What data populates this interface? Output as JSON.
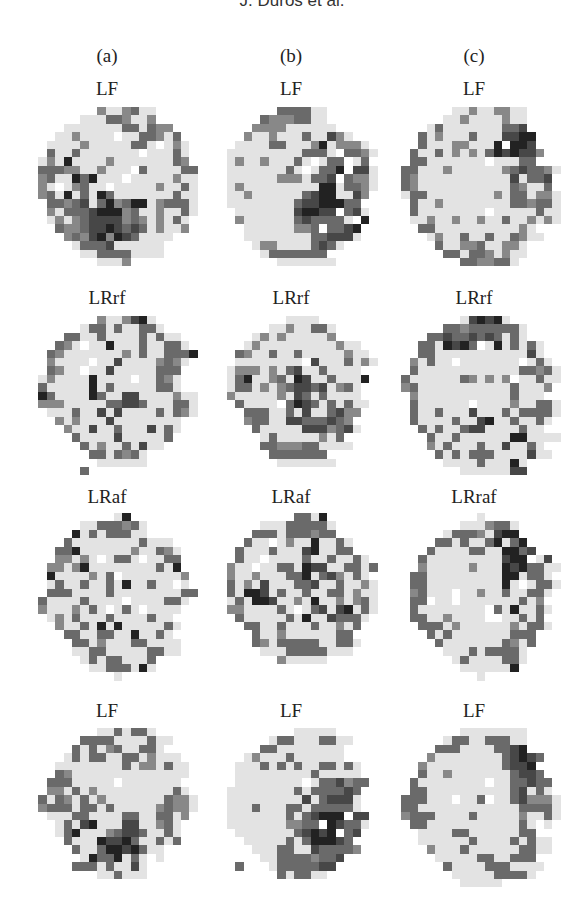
{
  "running_head": "J. Duros et al.",
  "columns": [
    {
      "label": "(a)",
      "center_x": 107
    },
    {
      "label": "(b)",
      "center_x": 291
    },
    {
      "label": "(c)",
      "center_x": 474
    }
  ],
  "chart_data": {
    "type": "heatmap",
    "title": "",
    "column_labels": [
      "(a)",
      "(b)",
      "(c)"
    ],
    "row_panel_titles": [
      [
        "LF",
        "LF",
        "LF"
      ],
      [
        "LRrf",
        "LRrf",
        "LRrf"
      ],
      [
        "LRaf",
        "LRaf",
        "LRraf"
      ],
      [
        "LF",
        "LF",
        "LF"
      ]
    ],
    "grid_size": [
      20,
      20
    ],
    "legend": {
      "o": "outside circle",
      "0": "light gray (#e3e3e3)",
      "w": "white",
      "1": "#a8a8a8",
      "2": "#888888",
      "3": "#6a6a6a",
      "4": "#474747",
      "5": "#222222"
    },
    "panels": [
      {
        "row": 0,
        "col": 0,
        "title": "LF",
        "x": 30,
        "y": 107,
        "rows": [
          "oooooooo2002300ooooo",
          "oooooo000332002ooooo",
          "oooo0000000330322ooo",
          "ooo0020000w0033203oo",
          "oo0000200000330w020o",
          "oo30030000000w00030o",
          "o020500002000000032o",
          "o33322002000w30000330",
          "o2300535000w000002000",
          "o20w02300w0000020030o",
          "o2305030530000000300o",
          "oo3323403523550233300",
          "oo2033345552300200300o",
          "oo02023444423202030o",
          "ooo3223445434302002o",
          "oooo2324525430000ooo",
          "ooooo03334000000oooo",
          "oooooo0033330000oooo",
          "oooooooo0002ooooooooo",
          "oooooooooooooooooooo"
        ]
      },
      {
        "row": 0,
        "col": 1,
        "title": "LF",
        "x": 210,
        "y": 107,
        "rows": [
          "oooooooo333300oooooo",
          "oooooo32223300oooooo",
          "ooooo2222000000ooooo",
          "oooo2002000300420ooo",
          "ooo0000330002502220o",
          "oo0000000003330w3320",
          "oo0200200030w033w03o",
          "oo000000030w0335w440",
          "oo0000002220334w3220",
          "oo0200000000055033200",
          "oo00200000034550042o",
          "oo0000000034455533ooo",
          "ooo000000045544w340o",
          "ooo20000003433330w5o",
          "oooo000000223w3345oo",
          "oooo00000000334440oo",
          "ooooo02200003430ooooo",
          "oooooo03333333oooooo",
          "oooooooo0000000ooooo",
          "oooooooooooooooooooo"
        ]
      },
      {
        "row": 0,
        "col": 2,
        "title": "LF",
        "x": 393,
        "y": 107,
        "rows": [
          "ooooooo002002200oooo",
          "oooooo0020000200oooo",
          "oooo030000000334ooooo",
          "ooo30200030004455oooo",
          "ooo3000220005w554ooo",
          "oo3003020203545442ooo",
          "oo330000000w00033oooo",
          "o3300020000002343320o",
          "o320000000000040334o",
          "o320000000000032003o",
          "o0330000000020330220o",
          "oo300200000000332330o",
          "oo300000000w00000300o",
          "oo002002002003002020o",
          "ooo33000000000020ooo",
          "oooo02003003003200oooo",
          "ooooo30022300220ooooo",
          "oooooo3303320200ooooo",
          "oooooooo3322330ooooo",
          "oooooooooooooooooooo"
        ]
      },
      {
        "row": 1,
        "col": 0,
        "title": "LRrf",
        "x": 30,
        "y": 316,
        "rows": [
          "oooooooo2002450ooooo",
          "oooooo0330300330oooo",
          "oooo33003000030300ooo",
          "ooo320w005000300330o",
          "oo3200000002030033350o",
          "oo20000w00400002320o",
          "oo3200w00400000333oo",
          "o02000050000w00320o",
          "o30000050300000330o",
          "o5300005300440000200o",
          "o22200000334430003300o",
          "oo000300404000030320o",
          "ooo202000400000000oo",
          "oooo20040030004030oo",
          "ooooo300004000003oo",
          "oooooo3020030400oooo",
          "ooooooo3303230ooooo",
          "oooooooo000000oooooo",
          "oooooo3ooooooooooooo",
          "oooooooooooooooooooo"
        ]
      },
      {
        "row": 1,
        "col": 1,
        "title": "LRrf",
        "x": 210,
        "y": 316,
        "rows": [
          "ooooooooo0000ooooooo",
          "ooooooo00200330ooooo",
          "ooooo0202000002ooooo",
          "oooo02000000000200oo",
          "ooo3200300300000200o",
          "ooo00000000w40003020o",
          "oo0222020340030000oo",
          "oo03500230540030005o",
          "oo0330202344340230oo",
          "oo2000002043030000oo",
          "ooo30000w3543030300o",
          "oooo33300304003422oo",
          "oooo2330044333432oo",
          "ooooo3000004442340oo",
          "oooooo0300000203oooo",
          "oooooo33222330000oo",
          "ooooooo3333333oooooo",
          "oooooooo0000000ooooo",
          "oooooooooooooooooooo",
          "oooooooooooooooooooo"
        ]
      },
      {
        "row": 1,
        "col": 2,
        "title": "LRrf",
        "x": 393,
        "y": 316,
        "rows": [
          "oooooooo045450oooooo",
          "oooooo3323333330oooo",
          "oooo334334343030oooo",
          "ooo3305453w0503030oo",
          "ooo330000000000040oo",
          "oo20300w0000000w030o",
          "oo300000000000033230o",
          "o3000000320202w00300o",
          "o230000000000030002oo",
          "oo2000000000003000o",
          "oo3000000w0000200330o",
          "oo300300040003033330o",
          "oo30000300450030030o",
          "ooo303003440000300o",
          "oooo3003000000550000o",
          "oooo20300030040030oo",
          "ooooo30303330000400oo",
          "oooooo0000300050ooooo",
          "oooooooo00000044oooo",
          "oooooooooooooooooooo"
        ]
      },
      {
        "row": 2,
        "col": 0,
        "title": "LRaf",
        "x": 30,
        "y": 513,
        "rows": [
          "oooooooooo05oooooooo",
          "oooooo00333230oooooo",
          "ooooo503033300ooooo",
          "oooo3000000003000oo",
          "ooo335000000200320oo",
          "ooo22020w0330w0033o",
          "oo2202500000000305oo",
          "oo50000203w00000002oo",
          "oo030030030500300w0o",
          "oo3330000300000000330o",
          "o3000030000w0000330o",
          "o20002030w030w0000oo",
          "oo020300030000300oo",
          "ooo200305050000030oo",
          "oooo3300330050030o",
          "ooooo3302000330000oo",
          "ooooo0033000003300oo",
          "oooooo030330003ooooo",
          "ooooooo00333050ooooo",
          "oooooooooo0ooooooooo"
        ]
      },
      {
        "row": 2,
        "col": 1,
        "title": "LRaf",
        "x": 210,
        "y": 513,
        "rows": [
          "oooooooooo3305oooooo",
          "oooooo000333330ooooo",
          "ooooo3330333233ooooo",
          "oooo300w020050030ooo",
          "ooo30003000450033oo",
          "ooo300w000030030030o",
          "oo200w00330544003303o",
          "oo20020003350342030oo",
          "oo302040003340030020o",
          "oo305540300300330200o",
          "oo030554002050020230o",
          "oo22000030w034045030o",
          "ooo3000003050043330oo",
          "oooo33003000300203oo",
          "ooooo300200000033ooo",
          "ooooo3203333300330oo",
          "oooooo00033333000ooo",
          "oooooooo200000oooooo",
          "oooooooooooooooooooo",
          "oooooooooooooooooooo"
        ]
      },
      {
        "row": 2,
        "col": 2,
        "title": "LRraf",
        "x": 393,
        "y": 513,
        "rows": [
          "oooooooooo0ooooooooo",
          "oooooooo0002330ooooo",
          "oooooo033320455ooooo",
          "ooooo33030035035oooo",
          "oooo3000033005534oooo",
          "ooo3000000000455w04o",
          "ooo20000020005453300o",
          "oo33000000000550330o",
          "oo3300000000050w0330o",
          "oo23000w00200300330o",
          "oo33w00w0000000302o",
          "oo300000000w3050030o",
          "oo330020000ww00303oo",
          "ooo3330200000020330o",
          "oooo3030000000333oooo",
          "ooooo300000003203oooo",
          "oooooo0003033330oooo",
          "ooooooo030000330ooooo",
          "oooooooo0000005ooooo",
          "oooooooooo0ooooooooo"
        ]
      },
      {
        "row": 3,
        "col": 0,
        "title": "LF",
        "x": 30,
        "y": 728,
        "rows": [
          "oooooooo0030330ooooo",
          "oooooo33330000300ooo",
          "ooooo30302300330oooo",
          "oooo03033003302000oo",
          "ooo0000000030220300oo",
          "ooo3200000000000000o",
          "oo33300000w0000000oo",
          "oo22030200000000030o",
          "o3032030200000003220o",
          "o23330330300000232200o",
          "oo00033000033003302oo",
          "ooo030450004400230o",
          "ooo035000234430030oo",
          "oooo30005445300303oo",
          "ooooo30035545300ooo",
          "oooooo05335030w0ooo",
          "ooooo333030040ooooo",
          "oooooooo003000oooooo",
          "oooooooooooooooooooo",
          "oooooooooooooooooooo"
        ]
      },
      {
        "row": 3,
        "col": 1,
        "title": "LF",
        "x": 210,
        "y": 728,
        "rows": [
          "oooooooooo00000ooooo",
          "ooooooo0330003300ooo",
          "oooooo3300000000ooooo",
          "oooo020003000000ooo",
          "ooo000303030033030ooo",
          "ooo000000000300000oo",
          "ooo00000000w0334233o",
          "oo0000000030333343oo",
          "oo0000000004034440oo",
          "oo0003000330333330oo",
          "oo00000003034555w44oo",
          "oo00000002233w54330o",
          "ooo000000034545w34o",
          "oooo0000030355543oo",
          "ooooo0003300433332oo",
          "oooooo0033332334ooooo",
          "ooo3ooo03333344oooooo",
          "oooooooo303300oooooo",
          "oooooooooooooooooooo",
          "oooooooooooooooooooo"
        ]
      },
      {
        "row": 3,
        "col": 2,
        "title": "LF",
        "x": 393,
        "y": 728,
        "rows": [
          "oooooooo00000000oooo",
          "oooooo0330033300oooo",
          "ooooo33300003345oooo",
          "oooo20000000034543ooo",
          "ooo20000000003445ooo",
          "ooo300200000003443oo",
          "oo300000000w0033433o",
          "oo33000000000034030oo",
          "o333000w003w00342220o",
          "o3300000000000033330o",
          "o23330000300000200300o",
          "oo330000000000030w0oo",
          "ooo00003300000033oo",
          "ooo0000003000030300o",
          "oooo200030000003300oo",
          "ooooo000003300333oooo",
          "oooooo300003330000ooo",
          "ooooooo0000033330ooo",
          "oooooooo00000ooooooo",
          "oooooooooooooooooooo"
        ]
      }
    ]
  }
}
